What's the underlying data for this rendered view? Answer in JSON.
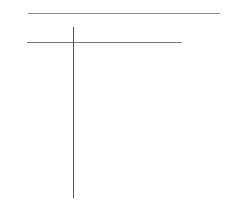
{
  "canvas": {
    "width": 236,
    "height": 220,
    "background": "#ffffff"
  },
  "lines": [
    {
      "id": "top-horizontal-rule",
      "orientation": "horizontal",
      "x1": 28,
      "y1": 13,
      "x2": 220,
      "y2": 13,
      "color": "#8a8a8a"
    },
    {
      "id": "second-horizontal-rule",
      "orientation": "horizontal",
      "x1": 27,
      "y1": 42,
      "x2": 182,
      "y2": 42,
      "color": "#7a7a7a"
    },
    {
      "id": "vertical-rule",
      "orientation": "vertical",
      "x1": 73,
      "y1": 27,
      "x2": 73,
      "y2": 198,
      "color": "#555555"
    }
  ]
}
